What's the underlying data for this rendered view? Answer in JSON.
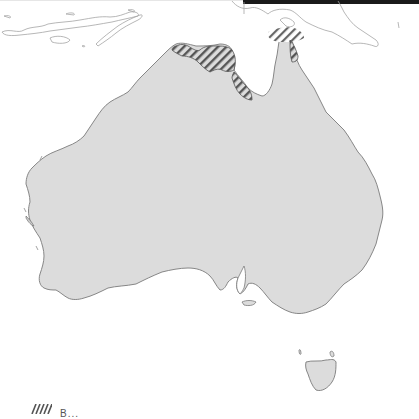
{
  "map": {
    "title": "Australia region map",
    "land_color": "#dcdcdc",
    "coast_color": "#777777",
    "hatch_color": "#555555",
    "neighbor_outline_color": "#9a9a9a",
    "regions": [
      {
        "name": "Mainland Australia",
        "fill": "land"
      },
      {
        "name": "Tasmania",
        "fill": "land"
      },
      {
        "name": "Top End (Northern Territory)",
        "fill": "hatched"
      },
      {
        "name": "Gulf of Carpentaria west coast",
        "fill": "hatched"
      },
      {
        "name": "Cape York / Torres Strait",
        "fill": "hatched"
      }
    ],
    "neighbors": [
      "Lesser Sunda Islands",
      "Timor",
      "New Guinea"
    ]
  },
  "legend": {
    "items": [
      {
        "pattern": "hatched",
        "label": "B..."
      }
    ]
  }
}
